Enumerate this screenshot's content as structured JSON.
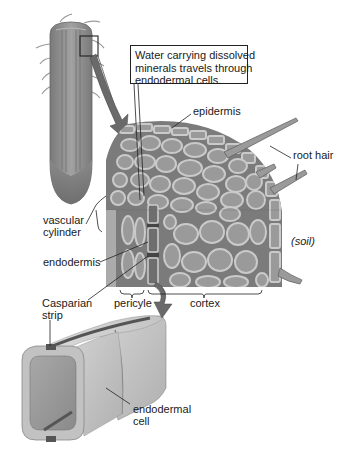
{
  "figure": {
    "background": "#ffffff",
    "colors": {
      "cell_fill": "#9a9a9a",
      "cell_wall": "#c9c9c9",
      "intercellular": "#777777",
      "endodermal_cell_dark": "#6e6e6e",
      "root_body": "#8c8c8c",
      "arrow": "#6a6a6a",
      "casparian_strip": "#555555",
      "line": "#222222"
    }
  },
  "callout": {
    "lines": [
      "Water carrying dissolved",
      "minerals travels through",
      "endodermal cells."
    ]
  },
  "labels": {
    "epidermis": "epidermis",
    "root_hair": "root hair",
    "soil": "(soil)",
    "vascular_cylinder": [
      "vascular",
      "cylinder"
    ],
    "endodermis": "endodermis",
    "casparian_strip": [
      "Casparian",
      "strip"
    ],
    "pericycle": "pericyle",
    "cortex": "cortex",
    "endodermal_cell": [
      "endodermal",
      "cell"
    ]
  }
}
